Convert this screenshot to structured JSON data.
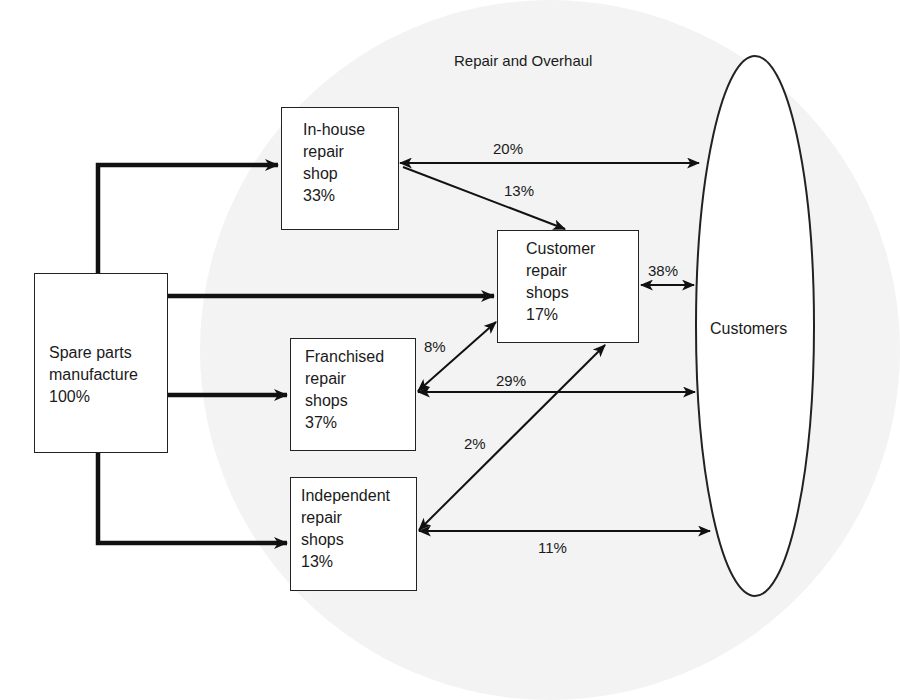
{
  "diagram": {
    "title": "Repair and Overhaul",
    "nodes": {
      "source": {
        "lines": [
          "Spare parts",
          "manufacture",
          "100%"
        ]
      },
      "inhouse": {
        "lines": [
          "In-house",
          "repair",
          "shop",
          "33%"
        ]
      },
      "customer_shops": {
        "lines": [
          "Customer",
          "repair",
          "shops",
          "17%"
        ]
      },
      "franchised": {
        "lines": [
          "Franchised",
          "repair",
          "shops",
          "37%"
        ]
      },
      "independent": {
        "lines": [
          "Independent",
          "repair",
          "shops",
          "13%"
        ]
      },
      "customers": {
        "label": "Customers"
      }
    },
    "flows": {
      "inhouse_customers": "20%",
      "inhouse_customer_shops": "13%",
      "customer_shops_customers": "38%",
      "franchised_customer_shops": "8%",
      "franchised_customers": "29%",
      "independent_customer_shops": "2%",
      "independent_customers": "11%"
    },
    "colors": {
      "line": "#111111",
      "box_border": "#222222",
      "shade": "#f3f3f3"
    }
  }
}
